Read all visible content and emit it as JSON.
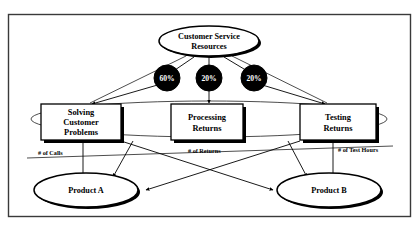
{
  "diagram": {
    "frame": {
      "present": true,
      "border_color": "#3a3a3a"
    },
    "resource_pool": {
      "id": "customer-service-resources",
      "shape": "ellipse",
      "line1": "Customer Service",
      "line2": "Resources"
    },
    "drivers": [
      {
        "id": "driver-60",
        "label": "60%",
        "shape": "filled-circle",
        "fill": "#000000",
        "text_color": "#ffffff"
      },
      {
        "id": "driver-20-a",
        "label": "20%",
        "shape": "filled-circle",
        "fill": "#000000",
        "text_color": "#ffffff"
      },
      {
        "id": "driver-20-b",
        "label": "20%",
        "shape": "filled-circle",
        "fill": "#000000",
        "text_color": "#ffffff"
      }
    ],
    "activities": [
      {
        "id": "activity-solving-customer-problems",
        "shape": "rectangle",
        "lines": [
          "Solving",
          "Customer",
          "Problems"
        ]
      },
      {
        "id": "activity-processing-returns",
        "shape": "rectangle",
        "lines": [
          "Processing",
          "Returns"
        ]
      },
      {
        "id": "activity-testing-returns",
        "shape": "rectangle",
        "lines": [
          "Testing",
          "Returns"
        ]
      }
    ],
    "activity_drivers": [
      {
        "id": "driver-label-calls",
        "label": "# of Calls"
      },
      {
        "id": "driver-label-returns",
        "label": "# of Returns"
      },
      {
        "id": "driver-label-test-hours",
        "label": "# of Test Hours"
      }
    ],
    "cost_objects": [
      {
        "id": "product-a",
        "shape": "ellipse",
        "label": "Product A"
      },
      {
        "id": "product-b",
        "shape": "ellipse",
        "label": "Product B"
      }
    ]
  }
}
